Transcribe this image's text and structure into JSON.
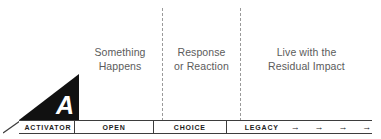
{
  "diagram": {
    "activator": {
      "letter": "A",
      "label": "ACTIVATOR"
    },
    "phases": [
      {
        "key": "open",
        "bar_label": "OPEN",
        "description_line1": "Something",
        "description_line2": "Happens"
      },
      {
        "key": "choice",
        "bar_label": "CHOICE",
        "description_line1": "Response",
        "description_line2": "or Reaction"
      },
      {
        "key": "legacy",
        "bar_label": "LEGACY",
        "description_line1": "Live with the",
        "description_line2": "Residual Impact"
      }
    ],
    "legacy_arrows": [
      "→",
      "→",
      "→",
      "→"
    ],
    "colors": {
      "triangle_fill": "#111111",
      "triangle_letter": "#ffffff",
      "bar_stroke": "#3d3d3d",
      "bar_label_text": "#1d1d1d",
      "description_text": "#5b5b5b",
      "divider_dash": "#9a9a9a",
      "background": "#ffffff"
    }
  }
}
